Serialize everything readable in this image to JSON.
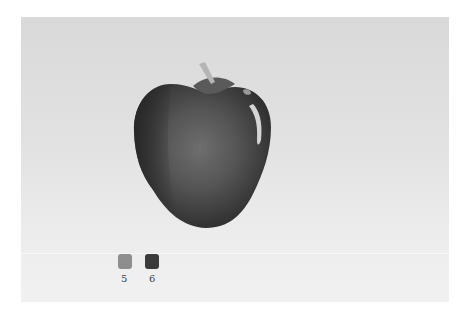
{
  "scene": {
    "subject": "watercolor painting of an apple on paper",
    "paper_color": "#e0e0e0",
    "apple": {
      "body_dark": "#2f2f2f",
      "body_mid": "#555555",
      "body_light": "#6f6f6f",
      "highlight": "#d8d8d8",
      "stem": "#b8b8b8"
    },
    "swatches": [
      {
        "label": "5",
        "color": "#8e8e8e"
      },
      {
        "label": "6",
        "color": "#3a3a3a"
      }
    ]
  }
}
